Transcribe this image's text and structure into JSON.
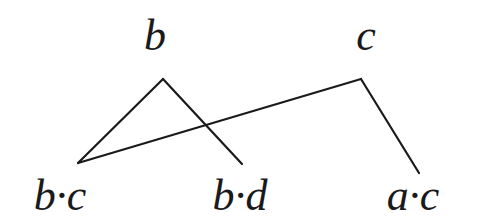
{
  "diagram": {
    "top_nodes": [
      {
        "label": "b"
      },
      {
        "label": "c"
      }
    ],
    "bottom_nodes": [
      {
        "label": "b·c"
      },
      {
        "label": "b·d"
      },
      {
        "label": "a·c"
      }
    ],
    "edges": [
      {
        "from": "b",
        "to": "b·c"
      },
      {
        "from": "b",
        "to": "b·d"
      },
      {
        "from": "c",
        "to": "b·c"
      },
      {
        "from": "c",
        "to": "a·c"
      }
    ],
    "line_color": "#1a1a1a"
  }
}
